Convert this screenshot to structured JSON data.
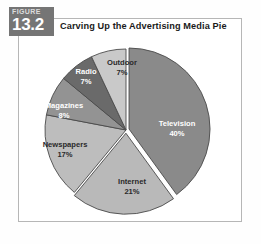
{
  "figure": {
    "badge_word": "FIGURE",
    "badge_number": "13.2",
    "title": "Carving Up the Advertising Media Pie"
  },
  "colors": {
    "badge_background": "#757575",
    "panel_border": "#b6b6b6",
    "slice_outline": "#4a4a4a",
    "television": "#8a8a8a",
    "internet": "#b9b9b9",
    "newspapers": "#bdbdbd",
    "magazines": "#939393",
    "radio": "#6a6a6a",
    "outdoor": "#c9c9c9"
  },
  "chart_data": {
    "type": "pie",
    "title": "Carving Up the Advertising Media Pie",
    "xlabel": "",
    "ylabel": "",
    "legend": "none",
    "grid": false,
    "start_angle_deg": 0,
    "direction": "clockwise",
    "categories": [
      "Television",
      "Internet",
      "Newspapers",
      "Magazines",
      "Radio",
      "Outdoor"
    ],
    "values": [
      40,
      21,
      17,
      8,
      7,
      7
    ],
    "unit": "%",
    "total": 100,
    "slices": [
      {
        "name": "Television",
        "label": "Television",
        "value": 40,
        "value_label": "40%",
        "color": "#8a8a8a",
        "label_color": "light",
        "exploded": true,
        "label_x": 159,
        "label_y": 88
      },
      {
        "name": "Internet",
        "label": "Internet",
        "value": 21,
        "value_label": "21%",
        "color": "#b9b9b9",
        "label_color": "dark",
        "exploded": true,
        "label_x": 114,
        "label_y": 146
      },
      {
        "name": "Newspapers",
        "label": "Newspapers",
        "value": 17,
        "value_label": "17%",
        "color": "#bdbdbd",
        "label_color": "dark",
        "exploded": false,
        "label_x": 47,
        "label_y": 109
      },
      {
        "name": "Magazines",
        "label": "Magazines",
        "value": 8,
        "value_label": "8%",
        "color": "#939393",
        "label_color": "light",
        "exploded": false,
        "label_x": 46,
        "label_y": 70
      },
      {
        "name": "Radio",
        "label": "Radio",
        "value": 7,
        "value_label": "7%",
        "color": "#6a6a6a",
        "label_color": "light",
        "exploded": false,
        "label_x": 68,
        "label_y": 36
      },
      {
        "name": "Outdoor",
        "label": "Outdoor",
        "value": 7,
        "value_label": "7%",
        "color": "#c9c9c9",
        "label_color": "dark",
        "exploded": false,
        "label_x": 104,
        "label_y": 27
      }
    ]
  }
}
